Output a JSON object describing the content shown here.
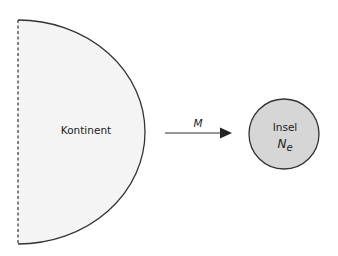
{
  "diagram": {
    "continent": {
      "label": "Kontinent",
      "fill": "#f4f4f4",
      "stroke": "#333333"
    },
    "migration": {
      "label": "M"
    },
    "island": {
      "label": "Insel",
      "size_label": "N",
      "size_subscript": "e",
      "fill": "#d6d6d6",
      "stroke": "#333333"
    }
  }
}
